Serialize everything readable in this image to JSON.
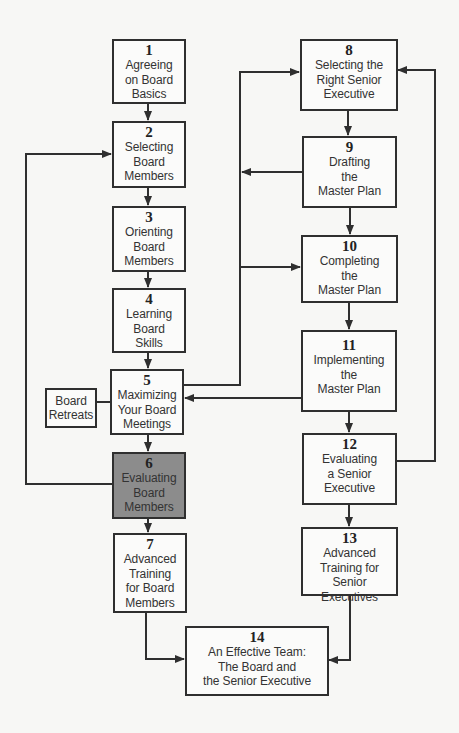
{
  "diagram": {
    "highlight_color": "#8c8c8c",
    "line_color": "#2f2f2f",
    "steps": [
      {
        "num": "1",
        "label": "Agreeing\non Board\nBasics"
      },
      {
        "num": "2",
        "label": "Selecting\nBoard\nMembers"
      },
      {
        "num": "3",
        "label": "Orienting\nBoard\nMembers"
      },
      {
        "num": "4",
        "label": "Learning\nBoard\nSkills"
      },
      {
        "num": "5",
        "label": "Maximizing\nYour Board\nMeetings"
      },
      {
        "num": "6",
        "label": "Evaluating\nBoard\nMembers",
        "highlighted": true
      },
      {
        "num": "7",
        "label": "Advanced\nTraining\nfor Board\nMembers"
      },
      {
        "num": "8",
        "label": "Selecting the\nRight Senior\nExecutive"
      },
      {
        "num": "9",
        "label": "Drafting\nthe\nMaster Plan"
      },
      {
        "num": "10",
        "label": "Completing\nthe\nMaster Plan"
      },
      {
        "num": "11",
        "label": "Implementing\nthe\nMaster Plan"
      },
      {
        "num": "12",
        "label": "Evaluating\na Senior\nExecutive"
      },
      {
        "num": "13",
        "label": "Advanced\nTraining for\nSenior Executives"
      },
      {
        "num": "14",
        "label": "An Effective Team:\nThe Board and\nthe Senior Executive"
      }
    ],
    "side_box": {
      "label": "Board\nRetreats"
    },
    "edges": [
      [
        "1",
        "2"
      ],
      [
        "2",
        "3"
      ],
      [
        "3",
        "4"
      ],
      [
        "4",
        "5"
      ],
      [
        "5",
        "6"
      ],
      [
        "6",
        "7"
      ],
      [
        "6",
        "2"
      ],
      [
        "5",
        "8"
      ],
      [
        "5",
        "10"
      ],
      [
        "9",
        "5"
      ],
      [
        "11",
        "5"
      ],
      [
        "8",
        "9"
      ],
      [
        "9",
        "10"
      ],
      [
        "10",
        "11"
      ],
      [
        "11",
        "12"
      ],
      [
        "12",
        "13"
      ],
      [
        "12",
        "8"
      ],
      [
        "7",
        "14"
      ],
      [
        "13",
        "14"
      ]
    ]
  }
}
